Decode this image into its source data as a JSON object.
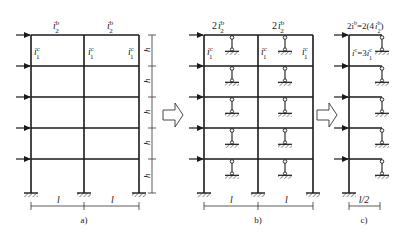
{
  "figure": {
    "panels": [
      {
        "id": "a",
        "caption": "a)",
        "beam_labels": [
          "i",
          "i"
        ],
        "beam_label_sup": "b",
        "beam_label_sub": "2",
        "column_labels": [
          "i",
          "i",
          "i"
        ],
        "column_label_sup": "c",
        "column_label_sub": "1",
        "story_height_label": "h",
        "span_labels": [
          "l",
          "l"
        ]
      },
      {
        "id": "b",
        "caption": "b)",
        "beam_label_prefix": "2",
        "beam_labels": [
          "i",
          "i"
        ],
        "beam_label_sup": "b",
        "beam_label_sub": "2",
        "column_labels": [
          "i",
          "i",
          "i"
        ],
        "column_label_sup": "c",
        "column_label_sub": "1",
        "span_labels": [
          "l",
          "l"
        ]
      },
      {
        "id": "c",
        "caption": "c)",
        "beam_label": "2i",
        "beam_label_sup": "b",
        "beam_label_rest": "=2(4",
        "beam_label_i": "i",
        "beam_label_rest_sup": "b",
        "beam_label_rest_sub": "2",
        "beam_label_close": ")",
        "column_label": "i",
        "column_label_sup": "c",
        "column_label_eq": "=3",
        "column_label_i": "i",
        "column_label_eq_sup": "c",
        "column_label_eq_sub": "1",
        "span_label": "l/2"
      }
    ],
    "transition_arrows": [
      "arrow-a-to-b",
      "arrow-b-to-c"
    ],
    "stories": 5
  }
}
